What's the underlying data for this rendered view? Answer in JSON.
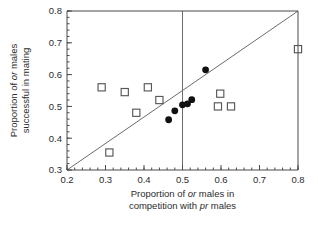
{
  "chart_data": {
    "type": "scatter",
    "title": "",
    "xlabel": "Proportion of or males in competition with pr males",
    "xlabel_lines": [
      "Proportion of or males in",
      "competition with pr males"
    ],
    "ylabel": "Proportion of or males successful in mating",
    "ylabel_lines": [
      "Proportion of or males",
      "successful in mating"
    ],
    "xlim": [
      0.2,
      0.8
    ],
    "ylim": [
      0.3,
      0.8
    ],
    "xticks": [
      0.2,
      0.3,
      0.4,
      0.5,
      0.6,
      0.7,
      0.8
    ],
    "xtick_labels": [
      "0.2",
      "0.3",
      "0.4",
      "0.5",
      "0.6",
      "0.7",
      "0.8"
    ],
    "yticks": [
      0.3,
      0.4,
      0.5,
      0.6,
      0.7,
      0.8
    ],
    "ytick_labels": [
      "0.3",
      "0.4",
      "0.5",
      "0.6",
      "0.7",
      "0.8"
    ],
    "x_minor_tick_step": 0.02,
    "y_minor_tick_step": 0.02,
    "grid": false,
    "legend": null,
    "reference_lines": [
      {
        "name": "identity-line",
        "kind": "diagonal",
        "from": [
          0.2,
          0.3
        ],
        "to": [
          0.8,
          0.8
        ],
        "color": "#6b6b6b"
      },
      {
        "name": "vertical-half-line",
        "kind": "vertical",
        "x": 0.5,
        "color": "#6b6b6b"
      }
    ],
    "series": [
      {
        "name": "open-squares",
        "marker": "open-square",
        "color": "#585858",
        "points": [
          [
            0.29,
            0.56
          ],
          [
            0.31,
            0.355
          ],
          [
            0.35,
            0.545
          ],
          [
            0.38,
            0.48
          ],
          [
            0.41,
            0.56
          ],
          [
            0.44,
            0.52
          ],
          [
            0.598,
            0.54
          ],
          [
            0.592,
            0.5
          ],
          [
            0.626,
            0.5
          ],
          [
            0.8,
            0.68
          ]
        ]
      },
      {
        "name": "filled-circles",
        "marker": "filled-circle",
        "color": "#111111",
        "points": [
          [
            0.464,
            0.458
          ],
          [
            0.48,
            0.486
          ],
          [
            0.5,
            0.505
          ],
          [
            0.513,
            0.508
          ],
          [
            0.524,
            0.521
          ],
          [
            0.56,
            0.615
          ]
        ]
      }
    ]
  }
}
